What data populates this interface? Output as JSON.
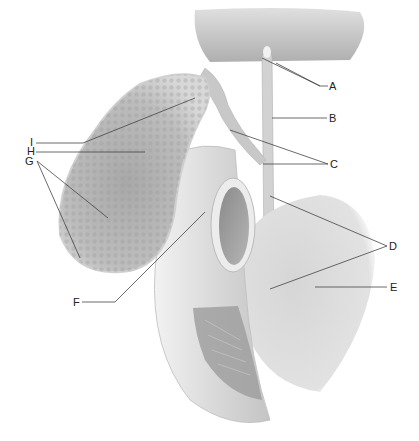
{
  "diagram": {
    "style": "grayscale anatomical illustration",
    "colors": {
      "background": "#ffffff",
      "organ_light": "#e6e6e6",
      "organ_mid": "#c8c8c8",
      "organ_dark": "#9a9a9a",
      "leader_line": "#444444",
      "label_text": "#222222"
    },
    "labels": [
      {
        "id": "A",
        "text": "A",
        "x": 329,
        "y": 90
      },
      {
        "id": "B",
        "text": "B",
        "x": 329,
        "y": 122
      },
      {
        "id": "C",
        "text": "C",
        "x": 330,
        "y": 168
      },
      {
        "id": "D",
        "text": "D",
        "x": 389,
        "y": 250
      },
      {
        "id": "E",
        "text": "E",
        "x": 390,
        "y": 291
      },
      {
        "id": "F",
        "text": "F",
        "x": 73,
        "y": 306
      },
      {
        "id": "I",
        "text": "I",
        "x": 30,
        "y": 146
      },
      {
        "id": "H",
        "text": "H",
        "x": 27,
        "y": 155
      },
      {
        "id": "G",
        "text": "G",
        "x": 25,
        "y": 165
      }
    ]
  }
}
